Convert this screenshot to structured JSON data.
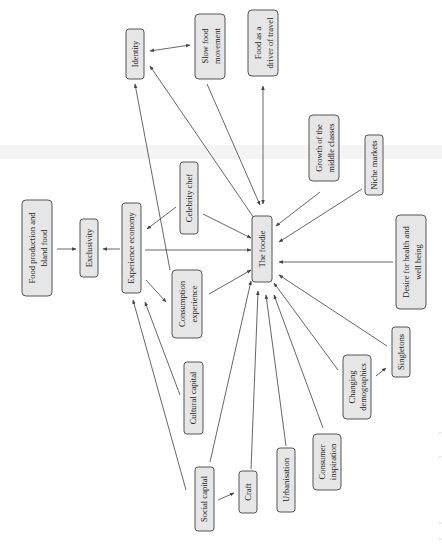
{
  "diagram": {
    "orientation": "rotated-90-ccw",
    "center_node": "The foodie",
    "nodes": {
      "identity": "Identity",
      "slow_food": [
        "Slow food",
        "movement"
      ],
      "food_travel": [
        "Food as a",
        "driver of travel"
      ],
      "growth_middle": [
        "Growth of the",
        "middle classes"
      ],
      "niche_markets": "Niche markets",
      "desire_health": [
        "Desire for health and",
        "well being"
      ],
      "singletons": "Singletons",
      "changing_demo": [
        "Changing",
        "demographics"
      ],
      "consumer_insp": [
        "Consumer",
        "inspiration"
      ],
      "urbanisation": "Urbanisation",
      "craft": "Craft",
      "social_capital": "Social capital",
      "cultural_capital": "Cultural capital",
      "consumption_exp": [
        "Consumption",
        "experience"
      ],
      "celebrity_chef": "Celebrity chef",
      "experience_economy": "Experience economy",
      "exclusivity": "Exclusivity",
      "food_production": [
        "Food production and",
        "bland food"
      ],
      "the_foodie": "The foodie"
    },
    "edges": [
      {
        "from": "Identity",
        "to": "Slow food movement",
        "type": "bidirectional"
      },
      {
        "from": "The foodie",
        "to": "Identity",
        "type": "directed"
      },
      {
        "from": "Experience economy",
        "to": "Identity",
        "type": "directed"
      },
      {
        "from": "Slow food movement",
        "to": "The foodie",
        "type": "directed"
      },
      {
        "from": "The foodie",
        "to": "Food as a driver of travel",
        "type": "bidirectional"
      },
      {
        "from": "Growth of the middle classes",
        "to": "The foodie",
        "type": "directed"
      },
      {
        "from": "Niche markets",
        "to": "The foodie",
        "type": "directed"
      },
      {
        "from": "Desire for health and well being",
        "to": "The foodie",
        "type": "directed"
      },
      {
        "from": "Singletons",
        "to": "The foodie",
        "type": "directed"
      },
      {
        "from": "Changing demographics",
        "to": "Singletons",
        "type": "directed"
      },
      {
        "from": "Changing demographics",
        "to": "The foodie",
        "type": "directed"
      },
      {
        "from": "Consumer inspiration",
        "to": "The foodie",
        "type": "directed"
      },
      {
        "from": "Urbanisation",
        "to": "The foodie",
        "type": "directed"
      },
      {
        "from": "Craft",
        "to": "The foodie",
        "type": "directed"
      },
      {
        "from": "Social capital",
        "to": "Craft",
        "type": "directed"
      },
      {
        "from": "Social capital",
        "to": "The foodie",
        "type": "directed"
      },
      {
        "from": "Social capital",
        "to": "Experience economy",
        "type": "directed"
      },
      {
        "from": "Cultural capital",
        "to": "Experience economy",
        "type": "directed"
      },
      {
        "from": "Consumption experience",
        "to": "The foodie",
        "type": "directed"
      },
      {
        "from": "Consumption experience",
        "to": "Identity",
        "type": "directed"
      },
      {
        "from": "Experience economy",
        "to": "Consumption experience",
        "type": "directed"
      },
      {
        "from": "Celebrity chef",
        "to": "Experience economy",
        "type": "directed"
      },
      {
        "from": "Celebrity chef",
        "to": "The foodie",
        "type": "directed"
      },
      {
        "from": "Experience economy",
        "to": "The foodie",
        "type": "directed"
      },
      {
        "from": "Experience economy",
        "to": "Exclusivity",
        "type": "directed"
      },
      {
        "from": "Food production and bland food",
        "to": "Exclusivity",
        "type": "directed"
      }
    ]
  }
}
